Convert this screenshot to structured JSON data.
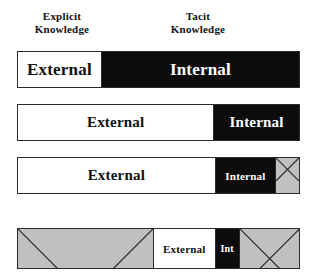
{
  "diagram": {
    "title_labels": [
      {
        "id": "explicit",
        "text": "Explicit\nKnowledge"
      },
      {
        "id": "tacit",
        "text": "Tacit\nKnowledge"
      }
    ],
    "colors": {
      "external_fill": "#ffffff",
      "internal_fill": "#0c0c0c",
      "hatched_fill": "#c0c0c0",
      "outline": "#2b2b2b",
      "text_dark": "#111111",
      "text_light": "#ffffff"
    },
    "bars": [
      {
        "id": "bar-1",
        "segments": [
          {
            "label": "External",
            "fill": "white",
            "width_pct": 29.5
          },
          {
            "label": "Internal",
            "fill": "black",
            "width_pct": 70.5
          }
        ]
      },
      {
        "id": "bar-2",
        "segments": [
          {
            "label": "External",
            "fill": "white",
            "width_pct": 69.5
          },
          {
            "label": "Internal",
            "fill": "black",
            "width_pct": 30.5
          }
        ]
      },
      {
        "id": "bar-3",
        "segments": [
          {
            "label": "External",
            "fill": "white",
            "width_pct": 70.0
          },
          {
            "label": "Internal",
            "fill": "black",
            "width_pct": 21.5
          },
          {
            "label": "",
            "fill": "hatch",
            "width_pct": 8.5
          }
        ]
      },
      {
        "id": "bar-4",
        "segments": [
          {
            "label": "",
            "fill": "hatch",
            "width_pct": 48.0
          },
          {
            "label": "External",
            "fill": "white",
            "width_pct": 22.0
          },
          {
            "label": "Int",
            "fill": "black",
            "width_pct": 8.5
          },
          {
            "label": "",
            "fill": "hatch",
            "width_pct": 21.5
          }
        ]
      }
    ]
  }
}
